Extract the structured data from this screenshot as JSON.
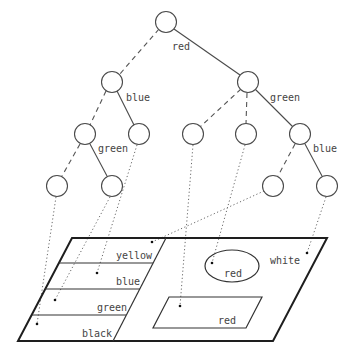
{
  "diagram": {
    "title": "",
    "tree": {
      "edge_labels": [
        {
          "id": "root-right",
          "text": "red",
          "x": 172,
          "y": 50
        },
        {
          "id": "l1left-right",
          "text": "blue",
          "x": 126,
          "y": 101
        },
        {
          "id": "l1right-right",
          "text": "green",
          "x": 270,
          "y": 101
        },
        {
          "id": "l2a-right",
          "text": "green",
          "x": 98,
          "y": 152
        },
        {
          "id": "l2e-right",
          "text": "blue",
          "x": 313,
          "y": 152
        }
      ]
    },
    "panel": {
      "stripe_labels": [
        {
          "text": "yellow",
          "x": 113,
          "y": 256
        },
        {
          "text": "blue",
          "x": 116,
          "y": 282
        },
        {
          "text": "green",
          "x": 97,
          "y": 308
        },
        {
          "text": "black",
          "x": 82,
          "y": 334
        }
      ],
      "region_labels": [
        {
          "text": "white",
          "x": 270,
          "y": 265
        },
        {
          "text": "red",
          "x": 224,
          "y": 277
        },
        {
          "text": "red",
          "x": 218,
          "y": 324
        }
      ]
    }
  }
}
